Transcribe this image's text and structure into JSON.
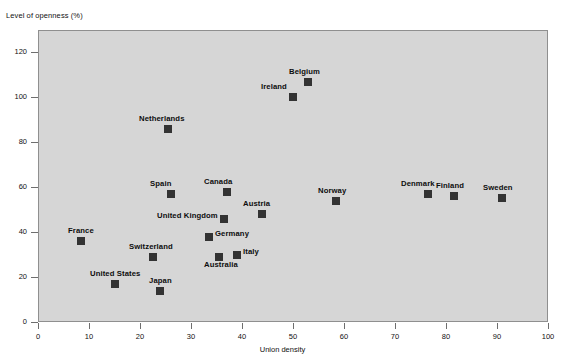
{
  "chart_data": {
    "type": "scatter",
    "title": "",
    "xlabel": "Union density",
    "ylabel": "Level of openness (%)",
    "xlim": [
      0,
      100
    ],
    "ylim": [
      0,
      130
    ],
    "xticks": [
      0,
      10,
      20,
      30,
      40,
      50,
      60,
      70,
      80,
      90,
      100
    ],
    "yticks": [
      0,
      20,
      40,
      60,
      80,
      100,
      120
    ],
    "grid": false,
    "legend": "none",
    "marker_color": "#333333",
    "panel_color": "#d6d6d6",
    "points": [
      {
        "label": "France",
        "x": 8.5,
        "y": 36,
        "label_dx": -22,
        "label_dy": -11
      },
      {
        "label": "United States",
        "x": 15,
        "y": 17,
        "label_dx": -42,
        "label_dy": -11
      },
      {
        "label": "Netherlands",
        "x": 25.5,
        "y": 86,
        "label_dx": -6,
        "label_dy": -11
      },
      {
        "label": "Switzerland",
        "x": 22.5,
        "y": 29,
        "label_dx": -26,
        "label_dy": -11
      },
      {
        "label": "Japan",
        "x": 24,
        "y": 14,
        "label_dx": -12,
        "label_dy": -11
      },
      {
        "label": "Spain",
        "x": 26,
        "y": 57,
        "label_dx": -10,
        "label_dy": -11
      },
      {
        "label": "United Kingdom",
        "x": 36.5,
        "y": 46,
        "label_dx": -84,
        "label_dy": 0
      },
      {
        "label": "Germany",
        "x": 33.5,
        "y": 38,
        "label_dx": 11,
        "label_dy": 0
      },
      {
        "label": "Australia",
        "x": 35.5,
        "y": 29,
        "label_dx": -11,
        "label_dy": 11
      },
      {
        "label": "Italy",
        "x": 39,
        "y": 30,
        "label_dx": 11,
        "label_dy": 0
      },
      {
        "label": "Canada",
        "x": 37,
        "y": 58,
        "label_dx": -9,
        "label_dy": -11
      },
      {
        "label": "Austria",
        "x": 44,
        "y": 48,
        "label_dx": -6,
        "label_dy": -11
      },
      {
        "label": "Ireland",
        "x": 50,
        "y": 100,
        "label_dx": -36,
        "label_dy": -2
      },
      {
        "label": "Belgium",
        "x": 53,
        "y": 107,
        "label_dx": -4,
        "label_dy": -11
      },
      {
        "label": "Norway",
        "x": 58.5,
        "y": 54,
        "label_dx": -4,
        "label_dy": -11
      },
      {
        "label": "Denmark",
        "x": 76.5,
        "y": 57,
        "label_dx": -10,
        "label_dy": -11
      },
      {
        "label": "Finland",
        "x": 81.5,
        "y": 56,
        "label_dx": -4,
        "label_dy": -11
      },
      {
        "label": "Sweden",
        "x": 91,
        "y": 55,
        "label_dx": -4,
        "label_dy": -11
      }
    ]
  }
}
